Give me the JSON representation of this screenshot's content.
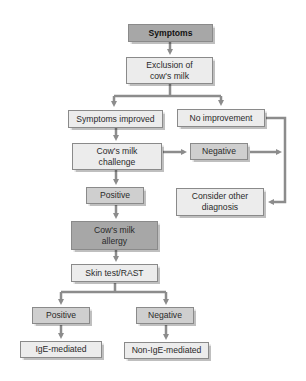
{
  "diagram": {
    "type": "flowchart",
    "colors": {
      "line": "#8c8c8c",
      "dark_box": "#a7a7a7",
      "mid_box": "#cfcfcf",
      "light_box": "#ececec"
    },
    "nodes": {
      "symptoms": "Symptoms",
      "exclusion": "Exclusion of cow's milk",
      "improved": "Symptoms improved",
      "no_improvement": "No improvement",
      "challenge": "Cow's milk challenge",
      "negative_challenge": "Negative",
      "consider": "Consider other diagnosis",
      "positive_challenge": "Positive",
      "allergy": "Cow's milk allergy",
      "skin_test": "Skin test/RAST",
      "positive_skin": "Positive",
      "negative_skin": "Negative",
      "ige": "IgE-mediated",
      "non_ige": "Non-IgE-mediated"
    },
    "edges": [
      [
        "symptoms",
        "exclusion"
      ],
      [
        "exclusion",
        "improved"
      ],
      [
        "exclusion",
        "no_improvement"
      ],
      [
        "improved",
        "challenge"
      ],
      [
        "challenge",
        "negative_challenge"
      ],
      [
        "negative_challenge",
        "consider"
      ],
      [
        "no_improvement",
        "consider"
      ],
      [
        "challenge",
        "positive_challenge"
      ],
      [
        "positive_challenge",
        "allergy"
      ],
      [
        "allergy",
        "skin_test"
      ],
      [
        "skin_test",
        "positive_skin"
      ],
      [
        "skin_test",
        "negative_skin"
      ],
      [
        "positive_skin",
        "ige"
      ],
      [
        "negative_skin",
        "non_ige"
      ]
    ]
  }
}
